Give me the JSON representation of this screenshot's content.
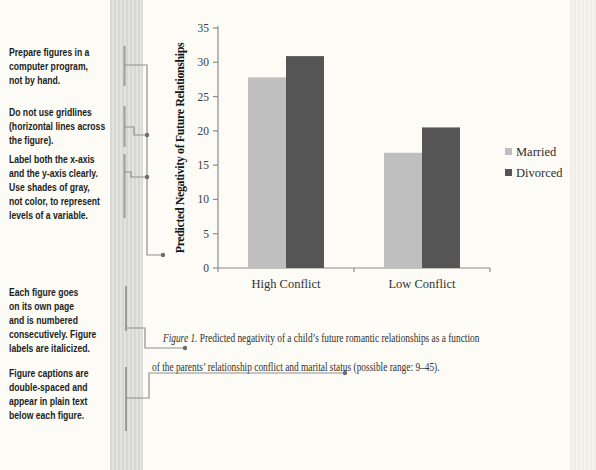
{
  "annotations": [
    {
      "text": "Prepare figures in a\ncomputer program,\nnot by hand."
    },
    {
      "text": "Do not use gridlines\n(horizontal lines across\nthe figure)."
    },
    {
      "text": "Label both the x-axis\nand the y-axis clearly.\nUse shades of gray,\nnot color, to represent\nlevels of a variable."
    },
    {
      "text": "Each figure goes\non its own page\nand is numbered\nconsecutively. Figure\nlabels are italicized."
    },
    {
      "text": "Figure captions are\ndouble-spaced and\nappear in plain text\nbelow each figure."
    }
  ],
  "chart_data": {
    "type": "bar",
    "title": "",
    "categories": [
      "High Conflict",
      "Low Conflict"
    ],
    "series": [
      {
        "name": "Married",
        "values": [
          27.8,
          16.8
        ],
        "color": "#bfbfbf"
      },
      {
        "name": "Divorced",
        "values": [
          30.9,
          20.5
        ],
        "color": "#555555"
      }
    ],
    "xlabel": "",
    "ylabel": "Predicted Negativity of Future Relationships",
    "ylim": [
      0,
      35
    ],
    "yticks": [
      0,
      5,
      10,
      15,
      20,
      25,
      30,
      35
    ],
    "grid": false,
    "legend_position": "right"
  },
  "caption": {
    "label": "Figure 1.",
    "line1": "Predicted negativity of a child’s future romantic relationships as a function",
    "line2": "of the parents’ relationship conflict and marital status (possible range: 9–45)."
  }
}
